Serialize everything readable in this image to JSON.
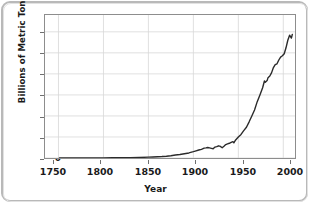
{
  "chart_data": {
    "type": "line",
    "title": "",
    "xlabel": "Year",
    "ylabel": "Billions of Metric Tons CO₂",
    "xlim": [
      1735,
      2013
    ],
    "ylim": [
      0,
      34
    ],
    "xticks": [
      1750,
      1800,
      1850,
      1900,
      1950,
      2000
    ],
    "yticks": [
      0,
      5,
      10,
      15,
      20,
      25,
      30
    ],
    "grid": true,
    "legend": "none",
    "line_color": "#2b2b2b",
    "series": [
      {
        "name": "Global CO2 emissions",
        "x": [
          1751,
          1760,
          1770,
          1780,
          1790,
          1800,
          1810,
          1820,
          1830,
          1840,
          1850,
          1855,
          1860,
          1865,
          1870,
          1875,
          1880,
          1885,
          1890,
          1895,
          1900,
          1903,
          1906,
          1909,
          1912,
          1914,
          1916,
          1918,
          1920,
          1922,
          1924,
          1926,
          1928,
          1930,
          1932,
          1934,
          1936,
          1938,
          1940,
          1942,
          1944,
          1945,
          1947,
          1950,
          1953,
          1956,
          1959,
          1962,
          1965,
          1968,
          1971,
          1974,
          1977,
          1979,
          1980,
          1982,
          1983,
          1985,
          1987,
          1989,
          1991,
          1993,
          1995,
          1997,
          1999,
          2001,
          2003,
          2005,
          2007,
          2009,
          2010
        ],
        "values": [
          0.01,
          0.01,
          0.01,
          0.02,
          0.03,
          0.03,
          0.05,
          0.06,
          0.08,
          0.13,
          0.2,
          0.24,
          0.3,
          0.35,
          0.43,
          0.55,
          0.7,
          0.82,
          1.0,
          1.2,
          1.5,
          1.7,
          1.9,
          2.05,
          2.35,
          2.4,
          2.5,
          2.4,
          2.3,
          2.2,
          2.6,
          2.7,
          2.9,
          2.75,
          2.45,
          2.8,
          3.2,
          3.35,
          3.5,
          3.7,
          3.9,
          3.6,
          4.3,
          5.0,
          5.6,
          6.5,
          7.3,
          8.6,
          10.0,
          11.4,
          13.4,
          15.0,
          16.7,
          18.3,
          18.0,
          18.4,
          19.1,
          19.5,
          20.3,
          21.5,
          22.2,
          22.4,
          23.3,
          24.0,
          24.3,
          24.8,
          26.2,
          28.0,
          29.2,
          28.5,
          29.4
        ]
      }
    ]
  },
  "ticks": {
    "y": [
      "30",
      "25",
      "20",
      "15",
      "10",
      "5",
      "0"
    ],
    "x": [
      "1750",
      "1800",
      "1850",
      "1900",
      "1950",
      "2000"
    ]
  }
}
